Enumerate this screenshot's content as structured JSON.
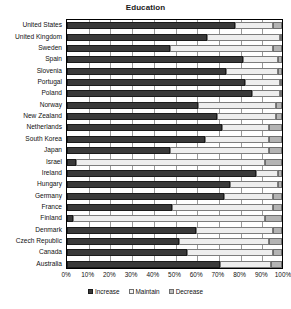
{
  "chart_data": {
    "type": "bar",
    "subtype": "stacked-horizontal-100pct",
    "title": "Education",
    "xlabel": "",
    "ylabel": "",
    "xlim": [
      0,
      100
    ],
    "grid": true,
    "legend_position": "bottom",
    "xticks": [
      "0%",
      "10%",
      "20%",
      "30%",
      "40%",
      "50%",
      "60%",
      "70%",
      "80%",
      "90%",
      "100%"
    ],
    "xtick_values": [
      0,
      10,
      20,
      30,
      40,
      50,
      60,
      70,
      80,
      90,
      100
    ],
    "categories": [
      "United States",
      "United Kingdom",
      "Sweden",
      "Spain",
      "Slovenia",
      "Portugal",
      "Poland",
      "Norway",
      "New Zealand",
      "Netherlands",
      "South Korea",
      "Japan",
      "Israel",
      "Ireland",
      "Hungary",
      "Germany",
      "France",
      "Finland",
      "Denmark",
      "Czech Republic",
      "Canada",
      "Australia"
    ],
    "series": [
      {
        "name": "Increase",
        "color": "#3a3a3a",
        "values": [
          78,
          65,
          48,
          82,
          74,
          83,
          86,
          61,
          70,
          72,
          64,
          48,
          4,
          88,
          76,
          73,
          49,
          3,
          60,
          52,
          56,
          71
        ]
      },
      {
        "name": "Maintain",
        "color": "#eeeeee",
        "values": [
          18,
          34,
          48,
          16,
          24,
          16,
          13,
          36,
          27,
          22,
          30,
          46,
          88,
          10,
          22,
          23,
          47,
          89,
          36,
          42,
          40,
          24
        ]
      },
      {
        "name": "Decrease",
        "color": "#b4b4b4",
        "values": [
          4,
          1,
          4,
          2,
          2,
          1,
          1,
          3,
          3,
          6,
          6,
          6,
          8,
          2,
          2,
          4,
          4,
          8,
          4,
          6,
          4,
          5
        ]
      }
    ]
  }
}
